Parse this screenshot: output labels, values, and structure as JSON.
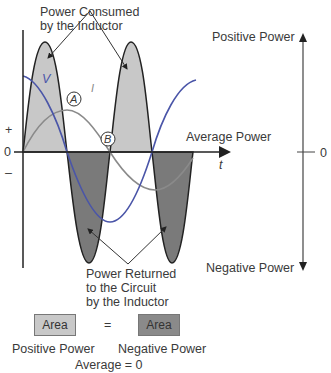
{
  "diagram": {
    "title_top": [
      "Power Consumed",
      "by the Inductor"
    ],
    "title_bottom": [
      "Power Returned",
      "to the Circuit",
      "by the Inductor"
    ],
    "axis": {
      "plus": "+",
      "zero": "0",
      "minus": "–",
      "time": "t",
      "average_label": "Average Power"
    },
    "curves": {
      "voltage_label": "V",
      "current_label": "I",
      "marker_a": "A",
      "marker_b": "B"
    },
    "right_scale": {
      "positive": "Positive Power",
      "negative": "Negative Power",
      "zero": "0"
    },
    "legend": {
      "positive_box": "Area",
      "equals": "=",
      "negative_box": "Area",
      "positive_caption": "Positive Power",
      "negative_caption": "Negative Power",
      "average": "Average = 0"
    },
    "colors": {
      "positive_fill": "#c8c8c8",
      "negative_fill": "#7a7a7a",
      "voltage": "#4a55a8",
      "current": "#8a8a8a",
      "axis": "#222222"
    }
  }
}
